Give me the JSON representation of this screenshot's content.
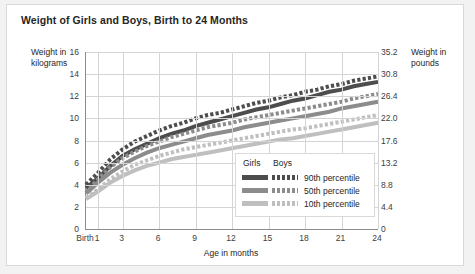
{
  "title": "Weight of Girls and Boys, Birth to 24 Months",
  "axes": {
    "left_title": "Weight in kilograms",
    "right_title": "Weight in pounds",
    "x_title": "Age in months"
  },
  "legend": {
    "header": [
      "Girls",
      "Boys"
    ],
    "rows": [
      {
        "label": "90th percentile"
      },
      {
        "label": "50th percentile"
      },
      {
        "label": "10th percentile"
      }
    ]
  },
  "colors": {
    "page_background": "#f2f2f2",
    "card_background": "#ffffff",
    "grid": "#d4d4d4",
    "axis": "#8c8c8c",
    "text": "#262626",
    "band_90": "#4d4d4d",
    "band_50": "#8c8c8c",
    "band_10": "#bfbfbf"
  },
  "chart_data": {
    "type": "line",
    "title": "Weight of Girls and Boys, Birth to 24 Months",
    "xlabel": "Age in months",
    "ylabel": "Weight in kilograms",
    "y2label": "Weight in pounds",
    "grid": true,
    "legend_position": "inside-bottom-right",
    "x": [
      0,
      1,
      2,
      3,
      4,
      5,
      6,
      7,
      8,
      9,
      10,
      11,
      12,
      13,
      14,
      15,
      16,
      17,
      18,
      19,
      20,
      21,
      22,
      23,
      24
    ],
    "xticks": [
      0,
      1,
      3,
      6,
      9,
      12,
      15,
      18,
      21,
      24
    ],
    "xtick_labels": [
      "Birth",
      "1",
      "3",
      "6",
      "9",
      "12",
      "15",
      "18",
      "21",
      "24"
    ],
    "ylim": [
      0,
      16
    ],
    "yticks": [
      0,
      2,
      4,
      6,
      8,
      10,
      12,
      14,
      16
    ],
    "ytick_labels": [
      "0",
      "2",
      "4",
      "6",
      "8",
      "10",
      "12",
      "14",
      "16"
    ],
    "y2lim": [
      0,
      35.2
    ],
    "y2ticks": [
      0,
      4.4,
      8.8,
      13.2,
      17.6,
      22.0,
      26.4,
      30.8,
      35.2
    ],
    "y2tick_labels": [
      "0",
      "4.4",
      "8.8",
      "13.2",
      "17.6",
      "22.0",
      "26.4",
      "30.8",
      "35.2"
    ],
    "series": [
      {
        "name": "Boys 90th percentile",
        "sex": "Boys",
        "percentile": 90,
        "style": "dashed",
        "color": "#4d4d4d",
        "values": [
          4.0,
          5.1,
          6.3,
          7.2,
          7.9,
          8.4,
          8.9,
          9.3,
          9.6,
          10.0,
          10.3,
          10.5,
          10.8,
          11.1,
          11.4,
          11.6,
          11.9,
          12.1,
          12.4,
          12.6,
          12.9,
          13.1,
          13.4,
          13.6,
          13.8
        ]
      },
      {
        "name": "Girls 90th percentile",
        "sex": "Girls",
        "percentile": 90,
        "style": "solid",
        "color": "#4d4d4d",
        "values": [
          3.7,
          4.6,
          5.7,
          6.6,
          7.2,
          7.7,
          8.2,
          8.6,
          8.9,
          9.3,
          9.6,
          9.9,
          10.2,
          10.5,
          10.8,
          11.0,
          11.3,
          11.6,
          11.8,
          12.1,
          12.4,
          12.6,
          12.9,
          13.1,
          13.3
        ]
      },
      {
        "name": "Boys 50th percentile",
        "sex": "Boys",
        "percentile": 50,
        "style": "dashed",
        "color": "#8c8c8c",
        "values": [
          3.3,
          4.5,
          5.6,
          6.4,
          7.0,
          7.5,
          7.9,
          8.3,
          8.6,
          8.9,
          9.2,
          9.4,
          9.6,
          9.9,
          10.1,
          10.3,
          10.5,
          10.7,
          10.9,
          11.1,
          11.3,
          11.5,
          11.8,
          12.0,
          12.2
        ]
      },
      {
        "name": "Girls 50th percentile",
        "sex": "Girls",
        "percentile": 50,
        "style": "solid",
        "color": "#8c8c8c",
        "values": [
          3.2,
          4.2,
          5.1,
          5.8,
          6.4,
          6.9,
          7.3,
          7.6,
          7.9,
          8.2,
          8.5,
          8.7,
          8.9,
          9.2,
          9.4,
          9.6,
          9.8,
          10.0,
          10.2,
          10.4,
          10.6,
          10.9,
          11.1,
          11.3,
          11.5
        ]
      },
      {
        "name": "Boys 10th percentile",
        "sex": "Boys",
        "percentile": 10,
        "style": "dashed",
        "color": "#bfbfbf",
        "values": [
          2.8,
          3.6,
          4.5,
          5.2,
          5.8,
          6.2,
          6.6,
          6.9,
          7.2,
          7.4,
          7.6,
          7.8,
          8.0,
          8.2,
          8.4,
          8.6,
          8.8,
          9.0,
          9.1,
          9.3,
          9.5,
          9.7,
          9.9,
          10.1,
          10.3
        ]
      },
      {
        "name": "Girls 10th percentile",
        "sex": "Girls",
        "percentile": 10,
        "style": "solid",
        "color": "#bfbfbf",
        "values": [
          2.7,
          3.4,
          4.2,
          4.8,
          5.3,
          5.7,
          6.0,
          6.3,
          6.5,
          6.7,
          6.9,
          7.1,
          7.3,
          7.5,
          7.7,
          7.9,
          8.1,
          8.2,
          8.4,
          8.6,
          8.8,
          9.0,
          9.2,
          9.4,
          9.6
        ]
      }
    ]
  }
}
